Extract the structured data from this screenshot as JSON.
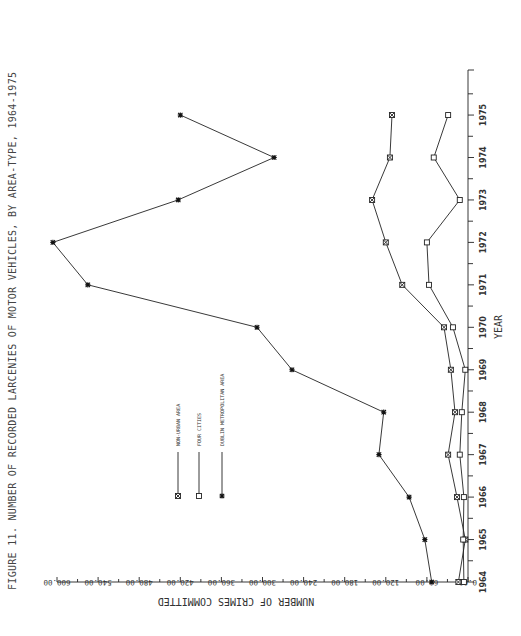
{
  "chart_data": {
    "type": "line",
    "title": "FIGURE 11. NUMBER OF RECORDED LARCENIES OF MOTOR VEHICLES, BY AREA-TYPE, 1964-1975",
    "xlabel": "YEAR",
    "ylabel": "NUMBER OF CRIMES COMMITTED",
    "orientation": "rotated 90 degrees counter-clockwise (page landscape)",
    "x": [
      1964,
      1965,
      1966,
      1967,
      1968,
      1969,
      1970,
      1971,
      1972,
      1973,
      1974,
      1975
    ],
    "x_tick_labels": [
      "1964",
      "1965",
      "1966",
      "1967",
      "1968",
      "1969",
      "1970",
      "1971",
      "1972",
      "1973",
      "1974",
      "1975"
    ],
    "y_tick_labels": [
      "0.00",
      "60.00",
      "120.00",
      "180.00",
      "240.00",
      "300.00",
      "360.00",
      "420.00",
      "480.00",
      "540.00",
      "600.00"
    ],
    "ylim": [
      0,
      600
    ],
    "grid": false,
    "legend_position": "inside, center-left",
    "series": [
      {
        "name": "NON-URBAN AREA",
        "marker": "x-box",
        "values": [
          14,
          4,
          16,
          29,
          19,
          25,
          35,
          96,
          120,
          140,
          114,
          111
        ]
      },
      {
        "name": "FOUR CITIES",
        "marker": "square",
        "values": [
          6,
          7,
          6,
          12,
          9,
          4,
          22,
          57,
          60,
          12,
          50,
          29
        ]
      },
      {
        "name": "DUBLIN METROPOLITAN AREA",
        "marker": "asterisk",
        "values": [
          53,
          63,
          86,
          130,
          123,
          257,
          308,
          555,
          606,
          423,
          283,
          420
        ]
      }
    ]
  }
}
